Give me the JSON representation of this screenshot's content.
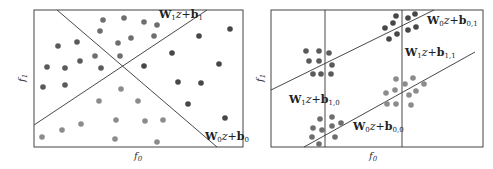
{
  "figure": {
    "left_panel": {
      "x_axis_label": "f",
      "x_axis_sub": "0",
      "y_axis_label": "f",
      "y_axis_sub": "1",
      "boundaries": [
        {
          "W": "W",
          "W_sub": "1",
          "rest": "z+",
          "b": "b",
          "b_sub": "1"
        },
        {
          "W": "W",
          "W_sub": "0",
          "rest": "z+",
          "b": "b",
          "b_sub": "0"
        }
      ]
    },
    "right_panel": {
      "x_axis_label": "f",
      "x_axis_sub": "0",
      "y_axis_label": "f",
      "y_axis_sub": "1",
      "boundaries": [
        {
          "W": "W",
          "W_sub": "0",
          "rest": "z+",
          "b": "b",
          "b_sub": "0,1"
        },
        {
          "W": "W",
          "W_sub": "1",
          "rest": "z+",
          "b": "b",
          "b_sub": "1,1"
        },
        {
          "W": "W",
          "W_sub": "1",
          "rest": "z+",
          "b": "b",
          "b_sub": "1,0"
        },
        {
          "W": "W",
          "W_sub": "0",
          "rest": "z+",
          "b": "b",
          "b_sub": "0,0"
        }
      ]
    },
    "colors": {
      "class_top": "#6e6e6e",
      "class_left": "#5a5a5a",
      "class_right": "#474747",
      "class_bottom": "#8c8c8c",
      "line": "#333333",
      "frame": "#444444"
    }
  }
}
